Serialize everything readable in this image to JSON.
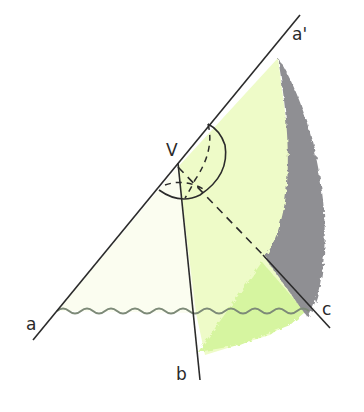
{
  "diagram": {
    "labels": {
      "vertex": "V",
      "a": "a",
      "a_prime": "a'",
      "b": "b",
      "c": "c"
    },
    "colors": {
      "line": "#2b2b2b",
      "pale_fill": "#fbfdf0",
      "light_green": "#eefbc8",
      "mid_green": "#d6f5a0",
      "grey_surface": "#8f8f93",
      "wavy": "#7d8a78"
    }
  }
}
